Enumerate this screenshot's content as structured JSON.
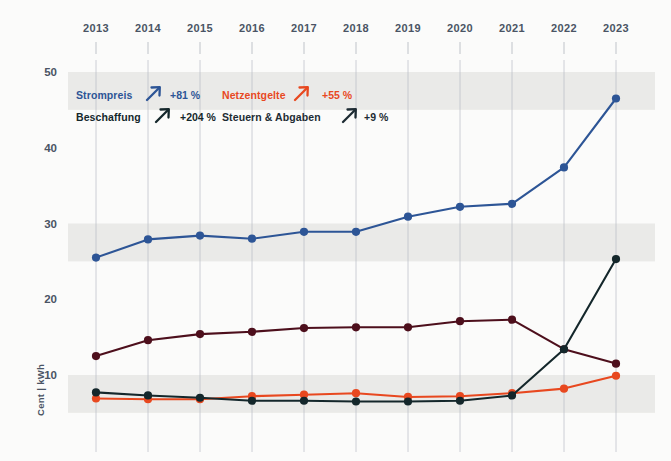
{
  "chart_data": {
    "type": "line",
    "title": "",
    "xlabel": "",
    "ylabel": "Cent | kWh",
    "x": [
      2013,
      2014,
      2015,
      2016,
      2017,
      2018,
      2019,
      2020,
      2021,
      2022,
      2023
    ],
    "xtick_labels": [
      "2013",
      "2014",
      "2015",
      "2016",
      "2017",
      "2018",
      "2019",
      "2020",
      "2021",
      "2022",
      "2023"
    ],
    "ytick_labels": [
      "10",
      "20",
      "30",
      "40",
      "50"
    ],
    "yticks": [
      10,
      20,
      30,
      40,
      50
    ],
    "ylim": [
      0,
      53
    ],
    "grid": "vertical",
    "band_shading": true,
    "legend_position": "top-left-inside",
    "series": [
      {
        "name": "Strompreis",
        "change_label": "+81 %",
        "color": "#2d5596",
        "values": [
          25.5,
          27.9,
          28.4,
          28.0,
          28.9,
          28.9,
          30.9,
          32.2,
          32.6,
          37.4,
          46.5
        ]
      },
      {
        "name": "Beschaffung",
        "change_label": "+204 %",
        "color": "#14272b",
        "values": [
          7.7,
          7.3,
          7.0,
          6.6,
          6.6,
          6.5,
          6.5,
          6.6,
          7.3,
          13.4,
          25.3
        ]
      },
      {
        "name": "Netzentgelte",
        "change_label": "+55 %",
        "color": "#e8481f",
        "values": [
          6.9,
          6.8,
          6.8,
          7.2,
          7.4,
          7.6,
          7.1,
          7.2,
          7.6,
          8.2,
          9.9
        ]
      },
      {
        "name": "Steuern & Abgaben",
        "change_label": "+9 %",
        "color": "#4d0f1c",
        "values": [
          12.5,
          14.6,
          15.4,
          15.7,
          16.2,
          16.3,
          16.3,
          17.1,
          17.3,
          13.4,
          11.5
        ]
      }
    ]
  },
  "legend": {
    "arrow_glyph": "↗",
    "items": [
      {
        "label": "Strompreis",
        "pct": "+81 %",
        "color": "#2d5596"
      },
      {
        "label": "Netzentgelte",
        "pct": "+55 %",
        "color": "#e8481f"
      },
      {
        "label": "Beschaffung",
        "pct": "+204 %",
        "color": "#14272b"
      },
      {
        "label": "Steuern & Abgaben",
        "pct": "+9 %",
        "color": "#1d2b33"
      }
    ]
  },
  "axes": {
    "y_axis_title": "Cent | kWh"
  },
  "colors": {
    "background": "#fbfbfa",
    "band": "#e4e4e2",
    "gridline": "#b8bcc4",
    "tick_text": "#4a5464"
  }
}
